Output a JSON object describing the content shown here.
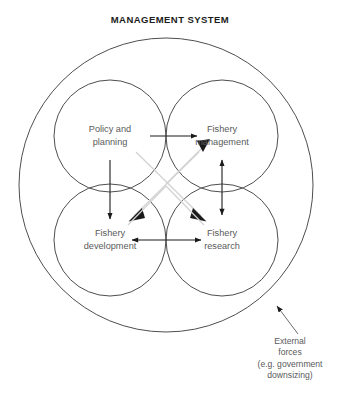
{
  "figure": {
    "title": "MANAGEMENT SYSTEM",
    "caption": "",
    "colors": {
      "outline": "#3a3a3a",
      "arrow": "#1a1a1a",
      "diagonal": "#d2d2d2",
      "text": "#5a5a5a",
      "title": "#1c1c1c",
      "background": "#ffffff"
    }
  },
  "outer_circle": {
    "name": "management-system-boundary",
    "cx": 166,
    "cy": 185,
    "r": 147
  },
  "nodes": [
    {
      "id": "policy",
      "lines": [
        "Policy and",
        "planning"
      ],
      "cx": 110,
      "cy": 136,
      "r": 56
    },
    {
      "id": "management",
      "lines": [
        "Fishery",
        "management"
      ],
      "cx": 222,
      "cy": 136,
      "r": 56
    },
    {
      "id": "development",
      "lines": [
        "Fishery",
        "development"
      ],
      "cx": 110,
      "cy": 240,
      "r": 56
    },
    {
      "id": "research",
      "lines": [
        "Fishery",
        "research"
      ],
      "cx": 222,
      "cy": 240,
      "r": 56
    }
  ],
  "arrows": [
    {
      "id": "policy-to-management",
      "from": "policy",
      "to": "management",
      "style": "solid-dark",
      "heads": "single"
    },
    {
      "id": "policy-to-development",
      "from": "policy",
      "to": "development",
      "style": "solid-dark",
      "heads": "single"
    },
    {
      "id": "research-to-management",
      "from": "research",
      "to": "management",
      "style": "solid-dark",
      "heads": "double"
    },
    {
      "id": "development-to-research",
      "from": "development",
      "to": "research",
      "style": "solid-dark",
      "heads": "double"
    },
    {
      "id": "policy-to-research-diagonal",
      "from": "policy",
      "to": "research",
      "style": "solid-gray",
      "heads": "single"
    },
    {
      "id": "management-to-development-diagonal",
      "from": "management",
      "to": "development",
      "style": "solid-gray",
      "heads": "single"
    }
  ],
  "callout": {
    "id": "external-forces",
    "lines": [
      "External",
      "forces",
      "(e.g. government",
      "downsizing)"
    ]
  }
}
